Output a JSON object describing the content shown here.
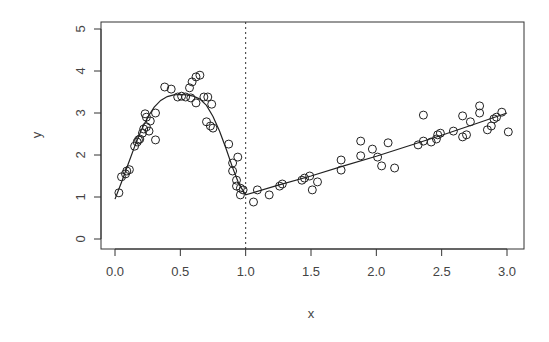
{
  "chart_data": {
    "type": "scatter",
    "title": "",
    "xlabel": "x",
    "ylabel": "y",
    "xlim": [
      0,
      3
    ],
    "ylim": [
      0,
      5
    ],
    "x_ticks": [
      "0.0",
      "0.5",
      "1.0",
      "1.5",
      "2.0",
      "2.5",
      "3.0"
    ],
    "y_ticks": [
      "0",
      "1",
      "2",
      "3",
      "4",
      "5"
    ],
    "grid": false,
    "legend": null,
    "vline": {
      "x": 1.0,
      "style": "dotted"
    },
    "series": [
      {
        "name": "points",
        "style": "open-circle",
        "points": [
          [
            0.03,
            1.1
          ],
          [
            0.05,
            1.48
          ],
          [
            0.08,
            1.55
          ],
          [
            0.09,
            1.62
          ],
          [
            0.11,
            1.65
          ],
          [
            0.15,
            2.21
          ],
          [
            0.17,
            2.31
          ],
          [
            0.19,
            2.38
          ],
          [
            0.18,
            2.36
          ],
          [
            0.21,
            2.52
          ],
          [
            0.22,
            2.62
          ],
          [
            0.24,
            2.67
          ],
          [
            0.26,
            2.57
          ],
          [
            0.23,
            2.98
          ],
          [
            0.24,
            2.9
          ],
          [
            0.27,
            2.81
          ],
          [
            0.31,
            3.0
          ],
          [
            0.31,
            2.36
          ],
          [
            0.38,
            3.62
          ],
          [
            0.43,
            3.57
          ],
          [
            0.48,
            3.38
          ],
          [
            0.51,
            3.4
          ],
          [
            0.54,
            3.38
          ],
          [
            0.58,
            3.36
          ],
          [
            0.57,
            3.6
          ],
          [
            0.59,
            3.74
          ],
          [
            0.62,
            3.86
          ],
          [
            0.65,
            3.9
          ],
          [
            0.62,
            3.24
          ],
          [
            0.68,
            3.38
          ],
          [
            0.71,
            3.38
          ],
          [
            0.74,
            3.21
          ],
          [
            0.7,
            2.79
          ],
          [
            0.73,
            2.69
          ],
          [
            0.75,
            2.64
          ],
          [
            0.87,
            2.26
          ],
          [
            0.94,
            1.95
          ],
          [
            0.9,
            1.81
          ],
          [
            0.9,
            1.62
          ],
          [
            0.93,
            1.4
          ],
          [
            0.93,
            1.26
          ],
          [
            0.96,
            1.21
          ],
          [
            0.98,
            1.17
          ],
          [
            0.96,
            1.05
          ],
          [
            1.06,
            0.88
          ],
          [
            1.09,
            1.17
          ],
          [
            1.18,
            1.05
          ],
          [
            1.26,
            1.26
          ],
          [
            1.28,
            1.31
          ],
          [
            1.43,
            1.4
          ],
          [
            1.45,
            1.45
          ],
          [
            1.49,
            1.5
          ],
          [
            1.51,
            1.17
          ],
          [
            1.55,
            1.36
          ],
          [
            1.73,
            1.88
          ],
          [
            1.73,
            1.64
          ],
          [
            1.88,
            2.33
          ],
          [
            1.88,
            1.98
          ],
          [
            1.97,
            2.14
          ],
          [
            2.01,
            1.95
          ],
          [
            2.04,
            1.74
          ],
          [
            2.09,
            2.29
          ],
          [
            2.14,
            1.69
          ],
          [
            2.32,
            2.24
          ],
          [
            2.36,
            2.95
          ],
          [
            2.36,
            2.33
          ],
          [
            2.42,
            2.31
          ],
          [
            2.46,
            2.38
          ],
          [
            2.47,
            2.48
          ],
          [
            2.49,
            2.52
          ],
          [
            2.59,
            2.57
          ],
          [
            2.66,
            2.93
          ],
          [
            2.72,
            2.79
          ],
          [
            2.66,
            2.43
          ],
          [
            2.69,
            2.48
          ],
          [
            2.79,
            3.17
          ],
          [
            2.79,
            3.0
          ],
          [
            2.85,
            2.6
          ],
          [
            2.88,
            2.69
          ],
          [
            2.9,
            2.86
          ],
          [
            2.92,
            2.9
          ],
          [
            2.96,
            3.02
          ],
          [
            3.01,
            2.55
          ]
        ]
      },
      {
        "name": "fit",
        "style": "line",
        "points": [
          [
            0.0,
            0.95
          ],
          [
            0.05,
            1.35
          ],
          [
            0.1,
            1.78
          ],
          [
            0.15,
            2.2
          ],
          [
            0.2,
            2.58
          ],
          [
            0.25,
            2.9
          ],
          [
            0.3,
            3.14
          ],
          [
            0.35,
            3.3
          ],
          [
            0.4,
            3.39
          ],
          [
            0.45,
            3.43
          ],
          [
            0.5,
            3.44
          ],
          [
            0.55,
            3.43
          ],
          [
            0.6,
            3.4
          ],
          [
            0.65,
            3.33
          ],
          [
            0.7,
            3.18
          ],
          [
            0.75,
            2.92
          ],
          [
            0.8,
            2.57
          ],
          [
            0.85,
            2.15
          ],
          [
            0.9,
            1.7
          ],
          [
            0.95,
            1.3
          ],
          [
            1.0,
            1.05
          ],
          [
            1.0,
            1.05
          ],
          [
            1.25,
            1.28
          ],
          [
            1.5,
            1.5
          ],
          [
            1.75,
            1.74
          ],
          [
            2.0,
            1.97
          ],
          [
            2.25,
            2.22
          ],
          [
            2.5,
            2.47
          ],
          [
            2.75,
            2.73
          ],
          [
            3.0,
            3.0
          ]
        ]
      }
    ]
  }
}
